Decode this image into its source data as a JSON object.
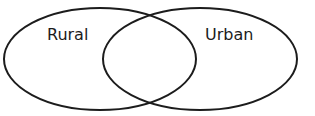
{
  "diagram": {
    "type": "venn",
    "stroke_color": "#1c1c1c",
    "text_color": "#1c1c1c",
    "sets": [
      {
        "label": "Rural",
        "cx": 100,
        "cy": 59,
        "rx": 96,
        "ry": 51,
        "label_x": 47,
        "label_y": 40
      },
      {
        "label": "Urban",
        "cx": 200,
        "cy": 59,
        "rx": 97,
        "ry": 51,
        "label_x": 205,
        "label_y": 40
      }
    ]
  }
}
